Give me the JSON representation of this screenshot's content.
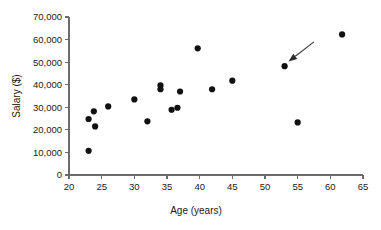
{
  "chart_data": {
    "type": "scatter",
    "title": "",
    "xlabel": "Age (years)",
    "ylabel": "Salary ($)",
    "xlim": [
      20,
      65
    ],
    "ylim": [
      0,
      70000
    ],
    "xticks": [
      20,
      25,
      30,
      35,
      40,
      45,
      50,
      55,
      60,
      65
    ],
    "xtick_labels": [
      "20",
      "25",
      "30",
      "35",
      "40",
      "45",
      "50",
      "55",
      "60",
      "65"
    ],
    "yticks": [
      0,
      10000,
      20000,
      30000,
      40000,
      50000,
      60000,
      70000
    ],
    "ytick_labels": [
      "0",
      "10,000",
      "20,000",
      "30,000",
      "40,000",
      "50,000",
      "60,000",
      "70,000"
    ],
    "grid": false,
    "legend": false,
    "marker": "circle",
    "marker_color": "#111111",
    "points": [
      {
        "x": 23.0,
        "y": 10700
      },
      {
        "x": 23.0,
        "y": 24800
      },
      {
        "x": 23.8,
        "y": 28200
      },
      {
        "x": 24.0,
        "y": 21500
      },
      {
        "x": 26.0,
        "y": 30400
      },
      {
        "x": 30.0,
        "y": 33500
      },
      {
        "x": 32.0,
        "y": 23800
      },
      {
        "x": 34.0,
        "y": 39700
      },
      {
        "x": 34.0,
        "y": 38000
      },
      {
        "x": 35.7,
        "y": 28900
      },
      {
        "x": 36.6,
        "y": 29800
      },
      {
        "x": 37.0,
        "y": 37000
      },
      {
        "x": 39.7,
        "y": 56100
      },
      {
        "x": 41.9,
        "y": 38000
      },
      {
        "x": 45.0,
        "y": 41800
      },
      {
        "x": 53.0,
        "y": 48200
      },
      {
        "x": 55.0,
        "y": 23300
      },
      {
        "x": 61.8,
        "y": 62300
      }
    ],
    "annotations": [
      {
        "name": "arrow-to-outlier",
        "type": "arrow",
        "tail": {
          "x": 57.5,
          "y": 59000
        },
        "head": {
          "x": 53.6,
          "y": 50300
        },
        "color": "#2b2b2b"
      }
    ]
  }
}
